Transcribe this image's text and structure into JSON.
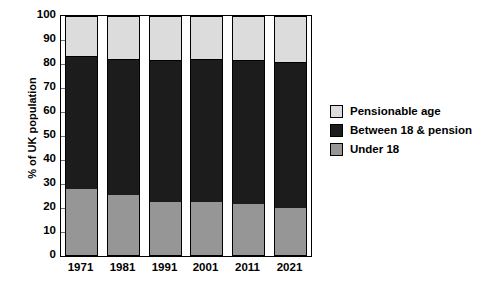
{
  "chart_data": {
    "type": "bar",
    "subtype": "stacked-percent",
    "title": "",
    "xlabel": "",
    "ylabel": "% of UK population",
    "ylim": [
      0,
      100
    ],
    "ytick_step": 10,
    "yticks": [
      0,
      10,
      20,
      30,
      40,
      50,
      60,
      70,
      80,
      90,
      100
    ],
    "ytick_labels": [
      "0",
      "10",
      "20",
      "30",
      "40",
      "50",
      "60",
      "70",
      "80",
      "90",
      "100"
    ],
    "grid": false,
    "legend_position": "right",
    "categories": [
      "1971",
      "1981",
      "1991",
      "2001",
      "2011",
      "2021"
    ],
    "series": [
      {
        "name": "Under 18",
        "color": "#969696",
        "values": [
          28,
          25.5,
          22.5,
          22.5,
          21.5,
          20
        ]
      },
      {
        "name": "Between 18 & pension",
        "color": "#1c1c1c",
        "values": [
          55.5,
          56.5,
          59,
          59.5,
          60,
          61
        ]
      },
      {
        "name": "Pensionable age",
        "color": "#dcdcdc",
        "values": [
          16.5,
          18,
          18.5,
          18,
          18.5,
          19
        ]
      }
    ],
    "stack_tops": {
      "under_18": [
        28,
        25.5,
        22.5,
        22.5,
        21.5,
        20
      ],
      "under_18_plus_working": [
        83.5,
        82,
        81.5,
        82,
        81.5,
        81
      ]
    }
  },
  "legend": {
    "items": [
      {
        "label": "Pensionable age",
        "color": "#dcdcdc"
      },
      {
        "label": "Between 18 & pension",
        "color": "#1c1c1c"
      },
      {
        "label": "Under 18",
        "color": "#969696"
      }
    ]
  },
  "axis": {
    "y_title": "% of UK population"
  },
  "colors": {
    "pensionable": "#dcdcdc",
    "working": "#1c1c1c",
    "under18": "#969696",
    "frame": "#000000",
    "tick": "#6f6f6f",
    "background": "#ffffff"
  }
}
